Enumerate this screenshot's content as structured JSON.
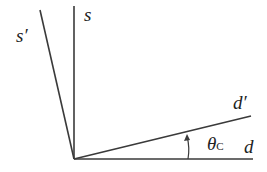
{
  "diagram": {
    "type": "rotated axes (mixing angle)",
    "labels": {
      "s": "s",
      "s_prime": "s′",
      "d_prime": "d′",
      "d": "d",
      "theta": "θ",
      "theta_sub": "C"
    },
    "origin": [
      74,
      159
    ],
    "lines": [
      {
        "name": "s-axis",
        "from": [
          74,
          159
        ],
        "to": [
          74,
          6
        ]
      },
      {
        "name": "s-prime-axis",
        "from": [
          74,
          159
        ],
        "to": [
          40,
          10
        ]
      },
      {
        "name": "d-axis",
        "from": [
          74,
          159
        ],
        "to": [
          253,
          159
        ]
      },
      {
        "name": "d-prime-axis",
        "from": [
          74,
          159
        ],
        "to": [
          251,
          116
        ]
      }
    ],
    "angle_marker": {
      "label": "θC",
      "between": [
        "d",
        "d′"
      ],
      "arrow_direction": "counterclockwise"
    },
    "line_color": "#3a3a3a"
  }
}
